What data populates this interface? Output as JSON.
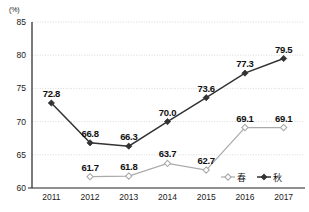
{
  "chart_data": {
    "type": "line",
    "title": "",
    "xlabel": "",
    "ylabel": "(%)",
    "unit_label": "(%)",
    "categories": [
      "2011",
      "2012",
      "2013",
      "2014",
      "2015",
      "2016",
      "2017"
    ],
    "ylim": [
      60,
      85
    ],
    "yticks": [
      "60",
      "65",
      "70",
      "75",
      "80",
      "85"
    ],
    "grid": true,
    "legend_position": "bottom-right",
    "series": [
      {
        "name": "春",
        "marker": "hollow-diamond",
        "color": "#aaaaaa",
        "values": [
          null,
          61.7,
          61.8,
          63.7,
          62.7,
          69.1,
          69.1
        ],
        "labels": [
          "",
          "61.7",
          "61.8",
          "63.7",
          "62.7",
          "69.1",
          "69.1"
        ]
      },
      {
        "name": "秋",
        "marker": "filled-diamond",
        "color": "#333333",
        "values": [
          72.8,
          66.8,
          66.3,
          70.0,
          73.6,
          77.3,
          79.5
        ],
        "labels": [
          "72.8",
          "66.8",
          "66.3",
          "70.0",
          "73.6",
          "77.3",
          "79.5"
        ]
      }
    ]
  },
  "legend": {
    "items": [
      {
        "label": "春",
        "marker": "hollow-diamond",
        "color": "#aaaaaa"
      },
      {
        "label": "秋",
        "marker": "filled-diamond",
        "color": "#333333"
      }
    ]
  }
}
